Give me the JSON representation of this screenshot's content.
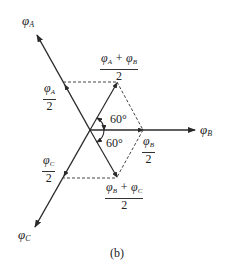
{
  "diagram": {
    "type": "phasor-diagram",
    "colors": {
      "line": "#2a2a2a",
      "dashed": "#444444"
    },
    "vectors": [
      {
        "id": "phi_A",
        "label_main": "φ",
        "label_sub": "A"
      },
      {
        "id": "phi_B",
        "label_main": "φ",
        "label_sub": "B"
      },
      {
        "id": "phi_C",
        "label_main": "φ",
        "label_sub": "C"
      }
    ],
    "labels": {
      "phiA": {
        "main": "φ",
        "sub": "A"
      },
      "phiB": {
        "main": "φ",
        "sub": "B"
      },
      "phiC": {
        "main": "φ",
        "sub": "C"
      },
      "halfA": {
        "num_main": "φ",
        "num_sub": "A",
        "den": "2"
      },
      "halfB": {
        "num_main": "φ",
        "num_sub": "B",
        "den": "2"
      },
      "halfC": {
        "num_main": "φ",
        "num_sub": "C",
        "den": "2"
      },
      "sumAB": {
        "t1": "φ",
        "s1": "A",
        "op": " + ",
        "t2": "φ",
        "s2": "B",
        "den": "2"
      },
      "sumBC": {
        "t1": "φ",
        "s1": "B",
        "op": " + ",
        "t2": "φ",
        "s2": "C",
        "den": "2"
      },
      "angle_upper": "60°",
      "angle_lower": "60°"
    },
    "caption": "(b)"
  }
}
